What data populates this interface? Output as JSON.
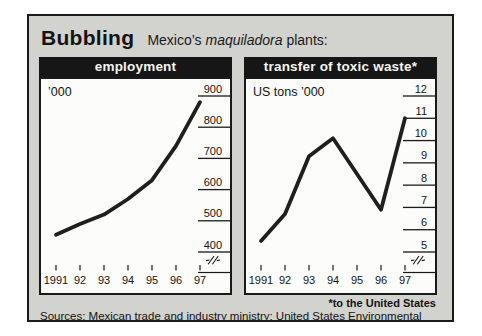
{
  "header": {
    "title": "Bubbling",
    "subtitle_prefix": "Mexico’s ",
    "subtitle_italic": "maquiladora",
    "subtitle_suffix": " plants:"
  },
  "footnote": "*to the United States",
  "sources": "Sources: Mexican trade and industry ministry; United States Environmental Protection Agency",
  "colors": {
    "board_background": "#d2d2ce",
    "panel_background": "#fcfcfa",
    "header_bar": "#161616",
    "ink": "#1a1a1a",
    "line": "#1f1f1f"
  },
  "chart_data": [
    {
      "type": "line",
      "title": "employment",
      "unit_label": "’000",
      "categories": [
        "1991",
        "92",
        "93",
        "94",
        "95",
        "96",
        "97"
      ],
      "x": [
        1991,
        1992,
        1993,
        1994,
        1995,
        1996,
        1997
      ],
      "values": [
        455,
        490,
        520,
        570,
        630,
        740,
        880
      ],
      "ylim": [
        400,
        900
      ],
      "yticks": [
        400,
        500,
        600,
        700,
        800,
        900
      ],
      "tick_side": "right",
      "axis_break": true,
      "grid": false,
      "legend": "none"
    },
    {
      "type": "line",
      "title": "transfer of toxic waste*",
      "unit_label": "US tons ’000",
      "categories": [
        "1991",
        "92",
        "93",
        "94",
        "95",
        "96",
        "97"
      ],
      "x": [
        1991,
        1992,
        1993,
        1994,
        1995,
        1996,
        1997
      ],
      "values": [
        5.5,
        6.7,
        9.3,
        10.1,
        8.5,
        6.9,
        11.0
      ],
      "ylim": [
        5,
        12
      ],
      "yticks": [
        5,
        6,
        7,
        8,
        9,
        10,
        11,
        12
      ],
      "tick_side": "right",
      "axis_break": true,
      "grid": false,
      "legend": "none"
    }
  ]
}
